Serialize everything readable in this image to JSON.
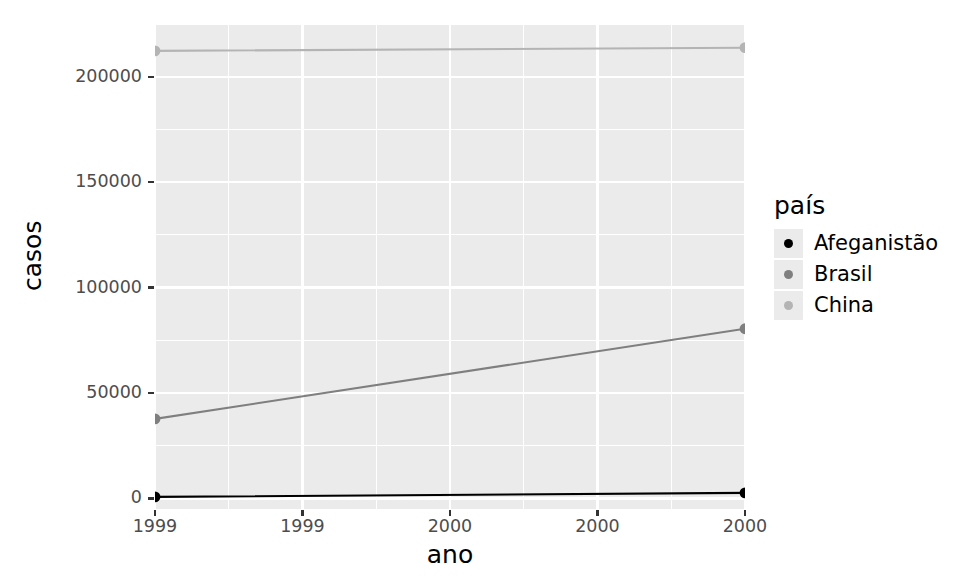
{
  "chart_data": {
    "type": "line",
    "title": "",
    "xlabel": "ano",
    "ylabel": "casos",
    "xlim": [
      1999,
      2000
    ],
    "ylim": [
      -5000,
      225000
    ],
    "grid": true,
    "legend_position": "right",
    "legend_title": "país",
    "x": [
      1999,
      2000
    ],
    "x_tick_labels": [
      "1999",
      "1999",
      "2000",
      "2000",
      "2000"
    ],
    "x_tick_values": [
      1999,
      1999.25,
      1999.5,
      1999.75,
      2000
    ],
    "y_tick_labels": [
      "0",
      "50000",
      "100000",
      "150000",
      "200000"
    ],
    "y_tick_values": [
      0,
      50000,
      100000,
      150000,
      200000
    ],
    "series": [
      {
        "name": "Afeganistão",
        "color": "#000000",
        "values": [
          745,
          2666
        ]
      },
      {
        "name": "Brasil",
        "color": "#7f7f7f",
        "values": [
          37737,
          80488
        ]
      },
      {
        "name": "China",
        "color": "#b4b4b4",
        "values": [
          212258,
          213766
        ]
      }
    ]
  },
  "theme": {
    "panel_background": "#ebebeb",
    "gridline_color": "#ffffff",
    "plot_background": "#ffffff",
    "axis_text_color": "#4d4d4d",
    "axis_title_color": "#000000"
  },
  "legend": {
    "title": "país",
    "entries": [
      {
        "label": "Afeganistão",
        "color": "#000000",
        "icon": "point-marker-icon"
      },
      {
        "label": "Brasil",
        "color": "#7f7f7f",
        "icon": "point-marker-icon"
      },
      {
        "label": "China",
        "color": "#b4b4b4",
        "icon": "point-marker-icon"
      }
    ]
  }
}
